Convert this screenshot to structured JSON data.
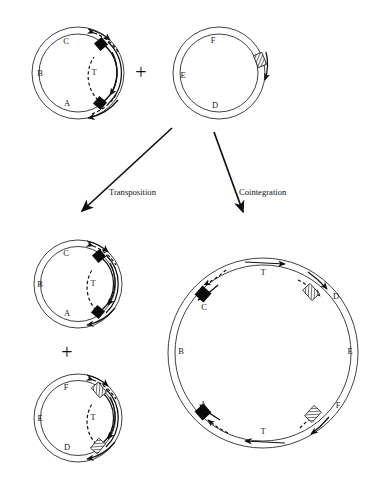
{
  "figure": {
    "background_color": "#ffffff",
    "line_color": "#111111",
    "ring_color": "#2b2b2b"
  },
  "operators": {
    "plus_top": "+",
    "plus_bottom": "+"
  },
  "pathways": [
    {
      "id": "transposition",
      "label": "Transposition",
      "direction": "down-left"
    },
    {
      "id": "cointegration",
      "label": "Cointegration",
      "direction": "down-right"
    }
  ],
  "plasmids": [
    {
      "id": "donor",
      "role": "donor-plasmid",
      "position": "top-left",
      "gene_labels": [
        "C",
        "B",
        "A"
      ],
      "transposon_label": "T",
      "end_marker": "black-diamond",
      "end_marker_count": 2,
      "target_marker": null
    },
    {
      "id": "recipient",
      "role": "recipient-plasmid",
      "position": "top-right",
      "gene_labels": [
        "F",
        "E",
        "D"
      ],
      "transposon_label": null,
      "end_marker": null,
      "target_marker": "hatched-box",
      "target_marker_count": 1
    },
    {
      "id": "product-donor",
      "role": "donor-plasmid-product",
      "position": "bottom-left-upper",
      "gene_labels": [
        "C",
        "B",
        "A"
      ],
      "transposon_label": "T",
      "end_marker": "black-diamond",
      "end_marker_count": 2,
      "target_marker": null
    },
    {
      "id": "product-recipient",
      "role": "recipient-plasmid-product",
      "position": "bottom-left-lower",
      "gene_labels": [
        "F",
        "E",
        "D"
      ],
      "transposon_label": "T",
      "end_marker": null,
      "target_marker": "hatched-box",
      "target_marker_count": 2
    },
    {
      "id": "cointegrate",
      "role": "cointegrate-plasmid",
      "position": "bottom-right",
      "gene_labels_left": [
        "C",
        "B",
        "A"
      ],
      "gene_labels_right": [
        "D",
        "E",
        "F"
      ],
      "transposon_labels": [
        "T",
        "T"
      ],
      "end_marker": "black-diamond",
      "end_marker_count": 2,
      "target_marker": "hatched-box",
      "target_marker_count": 2
    }
  ]
}
